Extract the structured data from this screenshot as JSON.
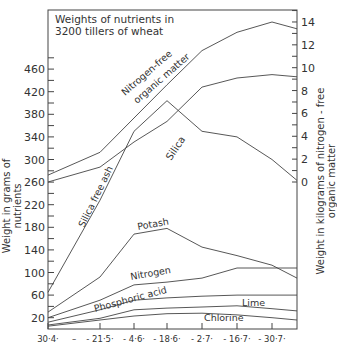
{
  "chart_data": {
    "type": "line",
    "title": "Weights of nutrients in 3200 tillers of wheat",
    "title_lines": [
      "Weights of nutrients in",
      "3200 tillers of wheat"
    ],
    "xlabel": "",
    "ylabel": "Weight in grams of nutrients",
    "ylabel_right": "Weight in kilograms of nitrogen-free organic matter",
    "x_tick_labels": [
      "30·4",
      "21·5",
      "4·6",
      "18·6",
      "2·7",
      "16·7",
      "30·7"
    ],
    "y_ticks_left": [
      20,
      60,
      100,
      140,
      180,
      220,
      260,
      300,
      340,
      380,
      420,
      460
    ],
    "y_ticks_right": [
      0,
      2,
      4,
      6,
      8,
      10,
      12,
      14
    ],
    "ylim_left": [
      0,
      480
    ],
    "ylim_right": [
      0,
      15
    ],
    "x_positions": [
      0,
      1,
      2,
      3,
      4,
      5,
      6,
      6.7
    ],
    "grid": false,
    "legend": "inline labels on curves",
    "series": [
      {
        "name": "Nitrogen free organic matter",
        "axis": "right",
        "values": [
          0.6,
          2.6,
          5.6,
          8.5,
          11.5,
          13.1,
          14.0,
          13.4
        ]
      },
      {
        "name": "Silica free ash",
        "axis": "left",
        "values": [
          65,
          228,
          350,
          404,
          350,
          340,
          300,
          263
        ]
      },
      {
        "name": "Silica",
        "axis": "right",
        "values": [
          0,
          1.3,
          3.5,
          5.3,
          8.3,
          9.1,
          9.4,
          9.2
        ]
      },
      {
        "name": "Potash",
        "axis": "left",
        "values": [
          30,
          92,
          168,
          178,
          145,
          130,
          113,
          90
        ]
      },
      {
        "name": "Nitrogen",
        "axis": "left",
        "values": [
          20,
          51,
          78,
          83,
          90,
          108,
          108,
          108
        ]
      },
      {
        "name": "Phosphoric acid",
        "axis": "left",
        "values": [
          12,
          34,
          51,
          55,
          58,
          60,
          60,
          60
        ]
      },
      {
        "name": "Lime",
        "axis": "left",
        "values": [
          7,
          19,
          34,
          37,
          39,
          41,
          36,
          32
        ]
      },
      {
        "name": "Chlorine",
        "axis": "left",
        "values": [
          5,
          16,
          23,
          27,
          28,
          25,
          20,
          16
        ]
      }
    ],
    "annotations": [
      "Nitrogen-free organic matter",
      "Silica free ash",
      "Silica",
      "Potash",
      "Nitrogen",
      "Phosphoric acid",
      "Lime",
      "Chlorine"
    ]
  },
  "labels": {
    "title_1": "Weights of nutrients in",
    "title_2": "3200 tillers of wheat",
    "ylabel_left": "Weight in grams of nutrients",
    "ylabel_right": "Weight in kilograms of nitrogen - free organic matter",
    "nfom_1": "Nitrogen-free",
    "nfom_2": "organic matter",
    "silica_free_ash": "Silica free ash",
    "silica": "Silica",
    "potash": "Potash",
    "nitrogen": "Nitrogen",
    "phosphoric_acid": "Phosphoric acid",
    "lime": "Lime",
    "chlorine": "Chlorine",
    "x_dash": "–"
  },
  "colors": {
    "line": "#444444",
    "text": "#333333",
    "background": "#ffffff"
  }
}
